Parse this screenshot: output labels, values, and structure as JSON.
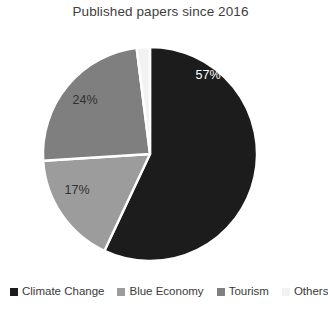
{
  "chart_data": {
    "type": "pie",
    "title": "Published papers since 2016",
    "categories": [
      "Climate Change",
      "Blue Economy",
      "Tourism",
      "Others"
    ],
    "values": [
      57,
      17,
      24,
      2
    ],
    "value_labels": [
      "57%",
      "17%",
      "24%",
      "2%"
    ],
    "colors": [
      "#1c1c1c",
      "#9c9c9c",
      "#7f7f7f",
      "#f2f2f2"
    ],
    "label_text_colors": [
      "#ffffff",
      "#303030",
      "#303030",
      "#303030"
    ],
    "units": "percent",
    "start_angle_deg": 0,
    "direction": "clockwise",
    "legend_position": "bottom",
    "grid": false,
    "xlabel": "",
    "ylabel": ""
  },
  "pie_geometry": {
    "center_x": 150,
    "center_y": 130,
    "radius": 107,
    "gap_stroke": "#ffffff"
  },
  "slice_label_positions": [
    {
      "text": "57%",
      "x": 208,
      "y": 52,
      "color_class": "label-light"
    },
    {
      "text": "17%",
      "x": 77,
      "y": 167,
      "color_class": "label-dark"
    },
    {
      "text": "24%",
      "x": 85,
      "y": 77,
      "color_class": "label-dark"
    },
    {
      "text": "2%",
      "x": 143,
      "y": -5,
      "color_class": "label-dark"
    }
  ],
  "legend": {
    "items": [
      {
        "label": "Climate Change",
        "color": "#1c1c1c"
      },
      {
        "label": "Blue Economy",
        "color": "#9c9c9c"
      },
      {
        "label": "Tourism",
        "color": "#7f7f7f"
      },
      {
        "label": "Others",
        "color": "#f2f2f2"
      }
    ]
  }
}
